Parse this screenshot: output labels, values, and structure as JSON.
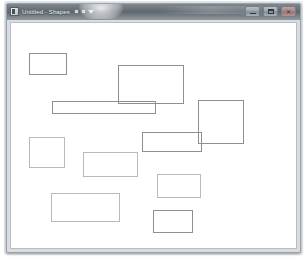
{
  "window": {
    "title": "Untitled - Shapes",
    "icon": "app-icon",
    "toolbar": {
      "undo_icon": "undo-icon",
      "redo_icon": "redo-icon",
      "dropdown_icon": "chevron-down-icon"
    },
    "controls": {
      "minimize_label": "Minimize",
      "minimize_icon": "minimize-icon",
      "maximize_label": "Maximize",
      "maximize_icon": "maximize-icon",
      "close_label": "Close",
      "close_icon": "close-icon"
    }
  },
  "canvas": {
    "name": "drawing-canvas",
    "background": "#ffffff",
    "stroke_color": "#a8a8ac",
    "shape_count": 11,
    "shapes": [
      {
        "id": "rect-1",
        "type": "rectangle",
        "x": 18,
        "y": 30,
        "w": 38,
        "h": 22,
        "weight": "strong"
      },
      {
        "id": "rect-2",
        "type": "rectangle",
        "x": 107,
        "y": 42,
        "w": 66,
        "h": 39,
        "weight": "strong"
      },
      {
        "id": "rect-3",
        "type": "rectangle",
        "x": 41,
        "y": 78,
        "w": 104,
        "h": 13,
        "weight": "strong"
      },
      {
        "id": "rect-4",
        "type": "rectangle",
        "x": 187,
        "y": 77,
        "w": 46,
        "h": 44,
        "weight": "strong"
      },
      {
        "id": "rect-5",
        "type": "rectangle",
        "x": 131,
        "y": 109,
        "w": 60,
        "h": 20,
        "weight": "strong"
      },
      {
        "id": "rect-6",
        "type": "rectangle",
        "x": 18,
        "y": 114,
        "w": 36,
        "h": 31,
        "weight": "faint"
      },
      {
        "id": "rect-7",
        "type": "rectangle",
        "x": 72,
        "y": 129,
        "w": 55,
        "h": 25,
        "weight": "faint"
      },
      {
        "id": "rect-8",
        "type": "rectangle",
        "x": 146,
        "y": 151,
        "w": 44,
        "h": 24,
        "weight": "faint"
      },
      {
        "id": "rect-9",
        "type": "rectangle",
        "x": 40,
        "y": 170,
        "w": 69,
        "h": 29,
        "weight": "faint"
      },
      {
        "id": "rect-10",
        "type": "rectangle",
        "x": 142,
        "y": 187,
        "w": 40,
        "h": 23,
        "weight": "strong"
      },
      {
        "id": "rect-11",
        "type": "rectangle",
        "x": 0,
        "y": 0,
        "w": 0,
        "h": 0,
        "weight": "faint"
      }
    ]
  }
}
